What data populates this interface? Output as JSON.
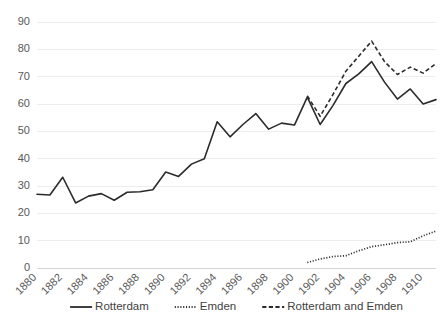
{
  "chart_data": {
    "type": "line",
    "title": "",
    "subtitle": "",
    "xlabel": "",
    "ylabel": "",
    "xlim": [
      1880,
      1911
    ],
    "ylim": [
      0,
      90
    ],
    "ytick_values": [
      0,
      10,
      20,
      30,
      40,
      50,
      60,
      70,
      80,
      90
    ],
    "ytick_labels": [
      "0",
      "10",
      "20",
      "30",
      "40",
      "50",
      "60",
      "70",
      "80",
      "90"
    ],
    "xtick_values": [
      1880,
      1882,
      1884,
      1886,
      1888,
      1890,
      1892,
      1894,
      1896,
      1898,
      1900,
      1902,
      1904,
      1906,
      1908,
      1910
    ],
    "xtick_labels": [
      "1880",
      "1882",
      "1884",
      "1886",
      "1888",
      "1890",
      "1892",
      "1894",
      "1896",
      "1898",
      "1900",
      "1902",
      "1904",
      "1906",
      "1908",
      "1910"
    ],
    "xtick_rotation": -45,
    "grid": "horizontal",
    "legend_position": "bottom",
    "x": [
      1880,
      1881,
      1882,
      1883,
      1884,
      1885,
      1886,
      1887,
      1888,
      1889,
      1890,
      1891,
      1892,
      1893,
      1894,
      1895,
      1896,
      1897,
      1898,
      1899,
      1900,
      1901,
      1902,
      1903,
      1904,
      1905,
      1906,
      1907,
      1908,
      1909,
      1910,
      1911
    ],
    "series": [
      {
        "name": "Rotterdam",
        "style": "solid",
        "color": "#2b2b2b",
        "x": [
          1880,
          1881,
          1882,
          1883,
          1884,
          1885,
          1886,
          1887,
          1888,
          1889,
          1890,
          1891,
          1892,
          1893,
          1894,
          1895,
          1896,
          1897,
          1898,
          1899,
          1900,
          1901,
          1902,
          1903,
          1904,
          1905,
          1906,
          1907,
          1908,
          1909,
          1910,
          1911
        ],
        "values": [
          27,
          26.7,
          33.2,
          23.8,
          26.3,
          27.2,
          24.8,
          27.7,
          27.9,
          28.6,
          35.1,
          33.5,
          38,
          40,
          53.5,
          48,
          52.5,
          56.5,
          50.8,
          53,
          52.3,
          62.5,
          52.5,
          59.5,
          67.5,
          71,
          75.5,
          68,
          61.8,
          65.5,
          60,
          61.6
        ]
      },
      {
        "name": "Emden",
        "style": "dotted",
        "color": "#2b2b2b",
        "x": [
          1901,
          1902,
          1903,
          1904,
          1905,
          1906,
          1907,
          1908,
          1909,
          1910,
          1911
        ],
        "values": [
          2,
          3.3,
          4.2,
          4.5,
          6.3,
          7.8,
          8.5,
          9.3,
          9.6,
          11.8,
          13.5
        ]
      },
      {
        "name": "Rotterdam and Emden",
        "style": "dashed",
        "color": "#2b2b2b",
        "x": [
          1901,
          1902,
          1903,
          1904,
          1905,
          1906,
          1907,
          1908,
          1909,
          1910,
          1911
        ],
        "values": [
          63,
          55.5,
          63.5,
          72,
          77.5,
          83,
          75.5,
          70.8,
          73.5,
          71.3,
          74.8
        ]
      }
    ]
  },
  "legend": {
    "items": [
      {
        "label": "Rotterdam",
        "style": "solid"
      },
      {
        "label": "Emden",
        "style": "dotted"
      },
      {
        "label": "Rotterdam and Emden",
        "style": "dashed"
      }
    ]
  }
}
